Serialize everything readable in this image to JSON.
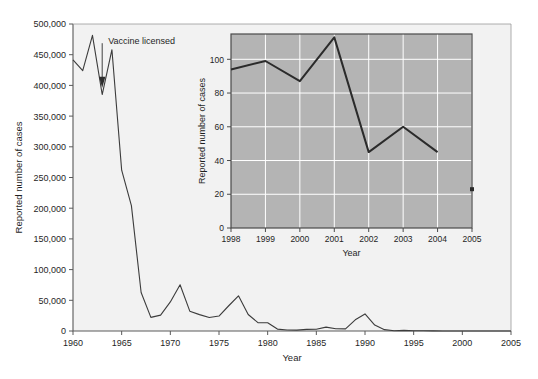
{
  "figure": {
    "background_color": "#ffffff",
    "main_panel_color": "#f2f2f2",
    "inset_panel_color": "#b4b4b4",
    "line_color": "#3c3c3c",
    "axis_color": "#5a5a5a",
    "grid_color": "#ffffff"
  },
  "main": {
    "xlabel": "Year",
    "ylabel": "Reported number of cases",
    "annotation": "Vaccine licensed",
    "annotation_year": 1963,
    "xticks": [
      "1960",
      "1965",
      "1970",
      "1975",
      "1980",
      "1985",
      "1990",
      "1995",
      "2000",
      "2005"
    ],
    "yticks": [
      "0",
      "50,000",
      "100,000",
      "150,000",
      "200,000",
      "250,000",
      "300,000",
      "350,000",
      "400,000",
      "450,000",
      "500,000"
    ]
  },
  "inset": {
    "xlabel": "Year",
    "ylabel": "Reported number of cases",
    "xticks": [
      "1998",
      "1999",
      "2000",
      "2001",
      "2002",
      "2003",
      "2004",
      "2005"
    ],
    "yticks": [
      "0",
      "20",
      "40",
      "60",
      "80",
      "100"
    ]
  },
  "chart_data": [
    {
      "type": "line",
      "id": "main-measles-cases",
      "title": "",
      "xlabel": "Year",
      "ylabel": "Reported number of cases",
      "xlim": [
        1960,
        2005
      ],
      "ylim": [
        0,
        500000
      ],
      "xticks": [
        1960,
        1965,
        1970,
        1975,
        1980,
        1985,
        1990,
        1995,
        2000,
        2005
      ],
      "yticks": [
        0,
        50000,
        100000,
        150000,
        200000,
        250000,
        300000,
        350000,
        400000,
        450000,
        500000
      ],
      "grid": false,
      "legend": "none",
      "annotations": [
        {
          "text": "Vaccine licensed",
          "x": 1963,
          "y": 400000,
          "arrow_to_y": 398000
        }
      ],
      "x": [
        1960,
        1961,
        1962,
        1963,
        1964,
        1965,
        1966,
        1967,
        1968,
        1969,
        1970,
        1971,
        1972,
        1973,
        1974,
        1975,
        1976,
        1977,
        1978,
        1979,
        1980,
        1981,
        1982,
        1983,
        1984,
        1985,
        1986,
        1987,
        1988,
        1989,
        1990,
        1991,
        1992,
        1993,
        1994,
        1995,
        1996,
        1997,
        1998,
        1999,
        2000,
        2001,
        2002,
        2003,
        2004,
        2005
      ],
      "values": [
        441703,
        423919,
        481530,
        385156,
        458083,
        261904,
        204136,
        62705,
        22231,
        25826,
        47351,
        75290,
        32275,
        26690,
        22094,
        24374,
        41126,
        57345,
        26871,
        13597,
        13506,
        3124,
        1714,
        1497,
        2587,
        2822,
        6282,
        3655,
        3396,
        18193,
        27786,
        9643,
        2237,
        312,
        963,
        309,
        508,
        138,
        100,
        100,
        86,
        116,
        44,
        56,
        37,
        66
      ]
    },
    {
      "type": "line",
      "id": "inset-recent-cases",
      "title": "",
      "xlabel": "Year",
      "ylabel": "Reported number of cases",
      "xlim": [
        1998,
        2005
      ],
      "ylim": [
        0,
        115
      ],
      "xticks": [
        1998,
        1999,
        2000,
        2001,
        2002,
        2003,
        2004,
        2005
      ],
      "yticks": [
        0,
        20,
        40,
        60,
        80,
        100
      ],
      "grid": true,
      "legend": "none",
      "x": [
        1998,
        1999,
        2000,
        2001,
        2002,
        2003,
        2004
      ],
      "values": [
        94,
        99,
        87,
        113,
        45,
        60,
        45
      ],
      "markers": [
        {
          "x": 2005,
          "y": 23
        }
      ]
    }
  ]
}
